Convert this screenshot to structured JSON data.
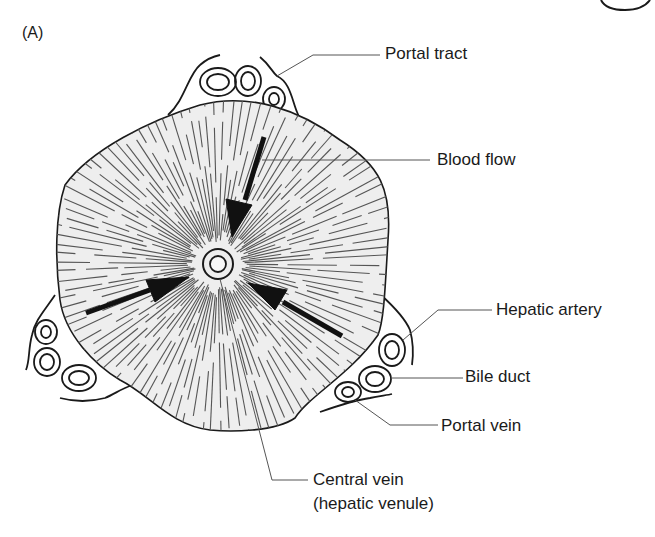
{
  "figure": {
    "panel_label": "(A)",
    "colors": {
      "lobule_fill": "#eeeeee",
      "stroke": "#1a1a1a",
      "sinusoid_lines": "#555555",
      "arrow": "#111111",
      "background": "#ffffff"
    }
  },
  "labels": {
    "portal_tract": "Portal tract",
    "blood_flow": "Blood flow",
    "hepatic_artery": "Hepatic artery",
    "bile_duct": "Bile duct",
    "portal_vein": "Portal vein",
    "central_vein_line1": "Central vein",
    "central_vein_line2": "(hepatic venule)"
  },
  "structures": {
    "central_vein": {
      "cx": 218,
      "cy": 264
    },
    "arrows": [
      {
        "name": "blood-flow-arrow-top",
        "from": [
          264,
          137
        ],
        "to": [
          232,
          236
        ]
      },
      {
        "name": "blood-flow-arrow-left",
        "from": [
          86,
          313
        ],
        "to": [
          188,
          277
        ]
      },
      {
        "name": "blood-flow-arrow-right",
        "from": [
          342,
          336
        ],
        "to": [
          248,
          283
        ]
      }
    ]
  }
}
